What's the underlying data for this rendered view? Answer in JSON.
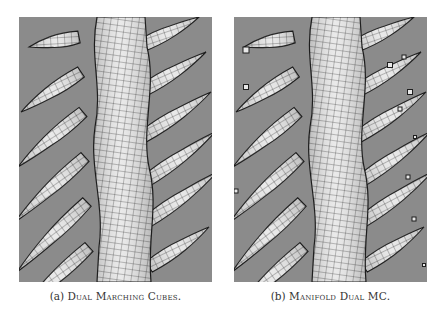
{
  "figure": {
    "subfigures": [
      {
        "id": "a",
        "label": "(a)",
        "caption": "Dual Marching Cubes.",
        "image": "mesh rendering of branching tubular structure with spurious thin/non-manifold branch tips",
        "has_floating_fragments": false
      },
      {
        "id": "b",
        "label": "(b)",
        "caption": "Manifold Dual MC.",
        "image": "mesh rendering of branching tubular structure with small isolated floating components",
        "has_floating_fragments": true
      }
    ],
    "colors": {
      "background": "#8b8b8b",
      "surface": "#e8e8e8",
      "wire": "#1e1e1e"
    }
  }
}
